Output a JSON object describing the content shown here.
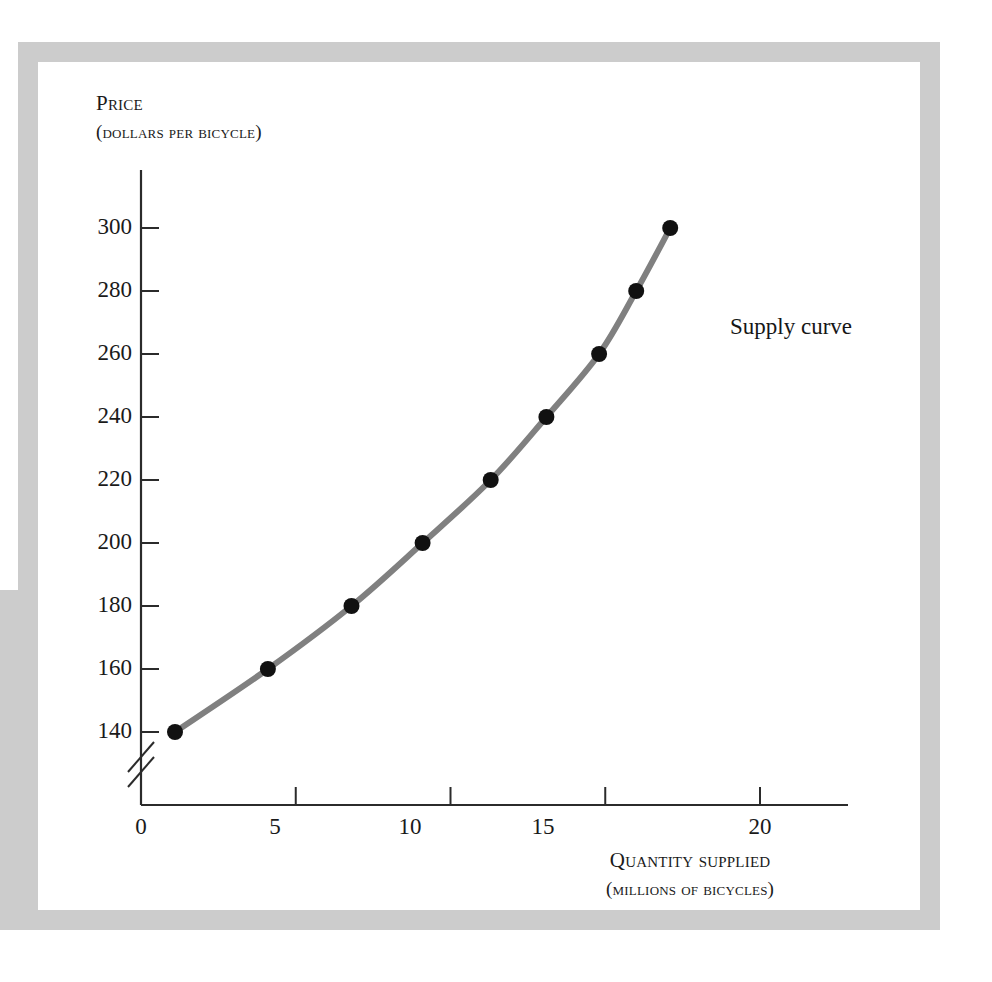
{
  "figure": {
    "background_color": "#ffffff",
    "frame_color": "#cccccc",
    "curve_color": "#808080",
    "marker_color": "#111111",
    "axis_color": "#2b2b2b"
  },
  "labels": {
    "y_axis_title_line1": "Price",
    "y_axis_title_line2": "(dollars per bicycle)",
    "x_axis_title_line1": "Quantity supplied",
    "x_axis_title_line2": "(millions of bicycles)",
    "curve_label": "Supply curve"
  },
  "chart_data": {
    "type": "line",
    "title": "",
    "xlabel": "Quantity supplied (millions of bicycles)",
    "ylabel": "Price (dollars per bicycle)",
    "xlim": [
      0,
      22
    ],
    "ylim": [
      130,
      310
    ],
    "grid": false,
    "legend_position": "inline-annotation",
    "axis_break_y": true,
    "axis_break_note": "y-axis broken below 140",
    "x_ticks": [
      0,
      5,
      10,
      15,
      20
    ],
    "x_tick_labels": [
      "0",
      "5",
      "10",
      "15",
      "20"
    ],
    "y_ticks": [
      140,
      160,
      180,
      200,
      220,
      240,
      260,
      280,
      300
    ],
    "y_tick_labels": [
      "140",
      "160",
      "180",
      "200",
      "220",
      "240",
      "260",
      "280",
      "300"
    ],
    "series": [
      {
        "name": "Supply curve",
        "marker": "filled-circle",
        "x": [
          1.1,
          4.1,
          6.8,
          9.1,
          11.3,
          13.1,
          14.8,
          16.0,
          17.1
        ],
        "y": [
          140,
          160,
          180,
          200,
          220,
          240,
          260,
          280,
          300
        ]
      }
    ],
    "points": [
      {
        "quantity": 1.1,
        "price": 140
      },
      {
        "quantity": 4.1,
        "price": 160
      },
      {
        "quantity": 6.8,
        "price": 180
      },
      {
        "quantity": 9.1,
        "price": 200
      },
      {
        "quantity": 11.3,
        "price": 220
      },
      {
        "quantity": 13.1,
        "price": 240
      },
      {
        "quantity": 14.8,
        "price": 260
      },
      {
        "quantity": 16.0,
        "price": 280
      },
      {
        "quantity": 17.1,
        "price": 300
      }
    ]
  }
}
